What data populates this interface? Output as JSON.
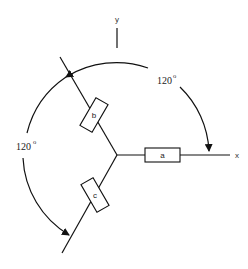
{
  "diagram": {
    "axes": {
      "x_label": "x",
      "y_label": "y"
    },
    "branches": [
      {
        "id": "a",
        "label": "a",
        "direction_deg": 0
      },
      {
        "id": "b",
        "label": "b",
        "direction_deg": 120
      },
      {
        "id": "c",
        "label": "c",
        "direction_deg": 240
      }
    ],
    "angles": [
      {
        "id": "right",
        "value": "120",
        "unit": "o",
        "between": "b -> a"
      },
      {
        "id": "left",
        "value": "120",
        "unit": "o",
        "between": "b -> c"
      }
    ],
    "colors": {
      "stroke": "#111111",
      "background": "#ffffff"
    }
  }
}
